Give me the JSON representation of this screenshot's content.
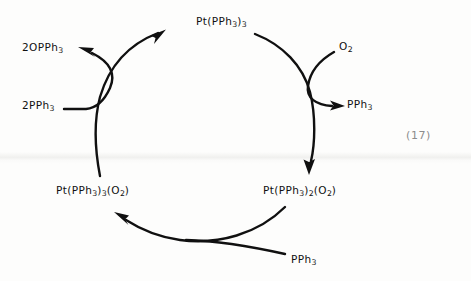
{
  "figure": {
    "kind": "catalytic-cycle-diagram",
    "equation_number": "(17)",
    "ink_color": "#101010",
    "equation_number_color": "#8c8c8c",
    "background_color": "#fdfdfc"
  },
  "species": {
    "top": {
      "name": "Pt(PPh3)3",
      "parts": [
        {
          "t": "Pt(PPh"
        },
        {
          "sub": "3"
        },
        {
          "t": ")"
        },
        {
          "sub": "3"
        }
      ]
    },
    "product_phosphine_oxide": {
      "name": "2OPPh3",
      "parts": [
        {
          "t": "2OPPh"
        },
        {
          "sub": "3"
        }
      ]
    },
    "reactant_dioxygen": {
      "name": "O2",
      "parts": [
        {
          "t": "O"
        },
        {
          "sub": "2"
        }
      ]
    },
    "reactant_phosphine_left": {
      "name": "2PPh3",
      "parts": [
        {
          "t": "2PPh"
        },
        {
          "sub": "3"
        }
      ]
    },
    "released_phosphine_right": {
      "name": "PPh3",
      "parts": [
        {
          "t": "PPh"
        },
        {
          "sub": "3"
        }
      ]
    },
    "bottom_left_complex": {
      "name": "Pt(PPh3)3(O2)",
      "parts": [
        {
          "t": "Pt(PPh"
        },
        {
          "sub": "3"
        },
        {
          "t": ")"
        },
        {
          "sub": "3"
        },
        {
          "t": "(O"
        },
        {
          "sub": "2"
        },
        {
          "t": ")"
        }
      ]
    },
    "bottom_right_complex": {
      "name": "Pt(PPh3)2(O2)",
      "parts": [
        {
          "t": "Pt(PPh"
        },
        {
          "sub": "3"
        },
        {
          "t": ")"
        },
        {
          "sub": "2"
        },
        {
          "t": "(O"
        },
        {
          "sub": "2"
        },
        {
          "t": ")"
        }
      ]
    },
    "reactant_phosphine_bottom": {
      "name": "PPh3",
      "parts": [
        {
          "t": "PPh"
        },
        {
          "sub": "3"
        }
      ]
    }
  },
  "arrows": [
    {
      "name": "cycle-arc-left-up",
      "from": "Pt(PPh3)3(O2)",
      "to": "Pt(PPh3)3",
      "direction": "counterclockwise"
    },
    {
      "name": "cycle-arc-right-down",
      "from": "Pt(PPh3)3",
      "to": "Pt(PPh3)2(O2)",
      "direction": "counterclockwise"
    },
    {
      "name": "cycle-arc-bottom-left",
      "from": "Pt(PPh3)2(O2)",
      "to": "Pt(PPh3)3(O2)",
      "direction": "counterclockwise"
    },
    {
      "name": "branch-2pph3-to-2opph3",
      "from": "2PPh3",
      "to": "2OPPh3",
      "direction": "up-left"
    },
    {
      "name": "branch-o2-to-pph3",
      "from": "O2",
      "to": "PPh3",
      "direction": "down-right"
    },
    {
      "name": "feed-pph3-bottom",
      "from": "PPh3",
      "to": "cycle",
      "direction": "up-left"
    }
  ]
}
